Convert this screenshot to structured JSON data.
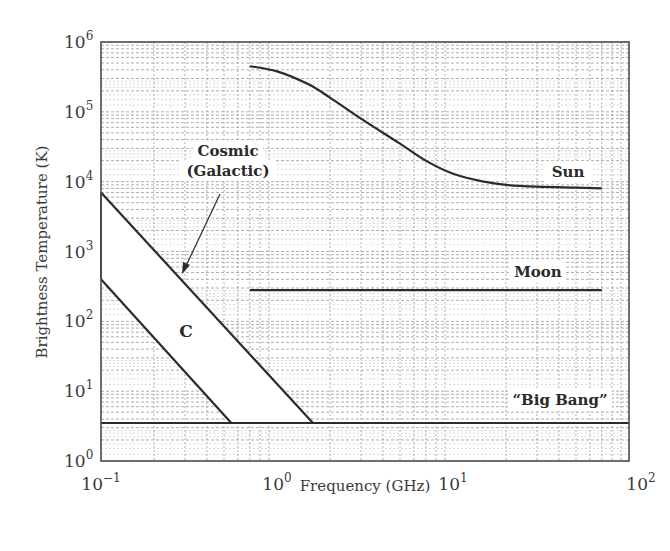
{
  "chart_data": {
    "type": "line",
    "title": "",
    "xlabel": "Frequency (GHz)",
    "ylabel": "Brightness Temperature (K)",
    "xscale": "log",
    "yscale": "log",
    "xlim": [
      0.1,
      100
    ],
    "ylim": [
      1,
      1000000
    ],
    "grid": true,
    "legend": "none (inline annotations)",
    "x_ticks": [
      {
        "base": "10",
        "exp": "−1",
        "value": 0.1
      },
      {
        "base": "10",
        "exp": "0",
        "value": 1
      },
      {
        "base": "10",
        "exp": "1",
        "value": 10
      },
      {
        "base": "10",
        "exp": "2",
        "value": 100
      }
    ],
    "y_ticks": [
      {
        "base": "10",
        "exp": "0",
        "value": 1
      },
      {
        "base": "10",
        "exp": "1",
        "value": 10
      },
      {
        "base": "10",
        "exp": "2",
        "value": 100
      },
      {
        "base": "10",
        "exp": "3",
        "value": 1000
      },
      {
        "base": "10",
        "exp": "4",
        "value": 10000
      },
      {
        "base": "10",
        "exp": "5",
        "value": 100000
      },
      {
        "base": "10",
        "exp": "6",
        "value": 1000000
      }
    ],
    "series": [
      {
        "name": "Sun",
        "x": [
          0.7,
          1.0,
          1.5,
          2.0,
          3.0,
          5.0,
          7.0,
          10.0,
          15.0,
          20.0,
          30.0,
          50.0,
          70.0
        ],
        "y": [
          450000,
          380000,
          250000,
          160000,
          80000,
          35000,
          20000,
          13000,
          10000,
          9000,
          8500,
          8200,
          8000
        ]
      },
      {
        "name": "Moon",
        "x": [
          0.7,
          70.0
        ],
        "y": [
          280,
          280
        ]
      },
      {
        "name": "\"Big Bang\"",
        "x": [
          0.1,
          100.0
        ],
        "y": [
          3.5,
          3.5
        ]
      },
      {
        "name": "Cosmic (Galactic) upper bound",
        "x": [
          0.1,
          1.6
        ],
        "y": [
          7000,
          3.5
        ]
      },
      {
        "name": "Cosmic (Galactic) lower bound",
        "x": [
          0.1,
          0.55
        ],
        "y": [
          400,
          3.5
        ]
      }
    ],
    "annotations": [
      {
        "text": "Sun",
        "x": 40,
        "y": 14000
      },
      {
        "text": "Moon",
        "x": 40,
        "y": 500
      },
      {
        "text": "“Big Bang”",
        "x": 38,
        "y": 6.5
      },
      {
        "text": "Cosmic",
        "x": 0.33,
        "y": 20000
      },
      {
        "text": "(Galactic)",
        "x": 0.33,
        "y": 10000
      },
      {
        "text": "C",
        "x": 0.29,
        "y": 100
      },
      {
        "text": "arrow from Cosmic label to band upper edge",
        "x": 0.28,
        "y": 1000
      }
    ]
  },
  "labels": {
    "xlabel": "Frequency (GHz)",
    "ylabel": "Brightness Temperature (K)",
    "sun": "Sun",
    "moon": "Moon",
    "bigbang": "“Big Bang”",
    "cosmic1": "Cosmic",
    "cosmic2": "(Galactic)",
    "c": "C"
  },
  "colors": {
    "line": "#2b2b2b",
    "grid": "#9a9a9a",
    "band_fill": "#ffffff",
    "text": "#3a3a3a"
  }
}
